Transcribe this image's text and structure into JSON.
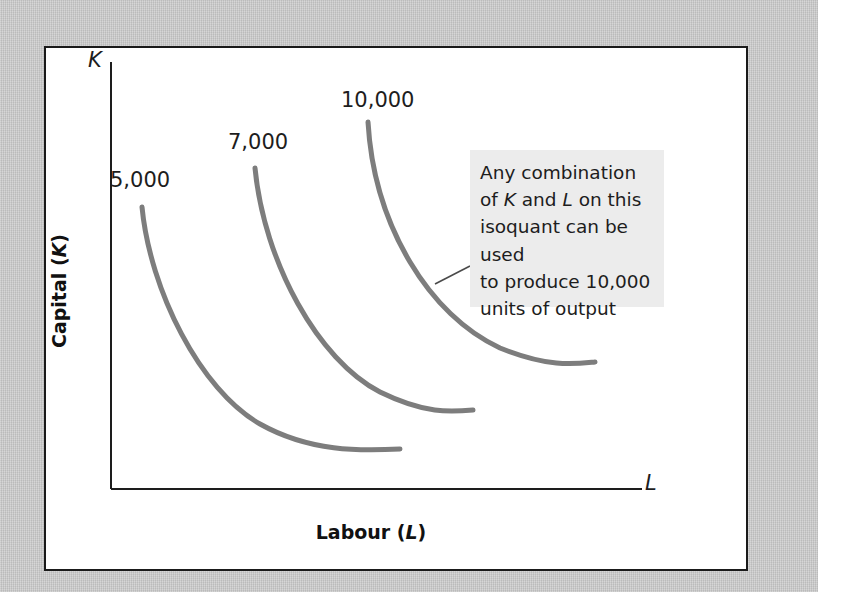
{
  "figure": {
    "type": "isoquant-map",
    "axes": {
      "y_axis_title": "Capital (K)",
      "y_axis_title_plain": "Capital",
      "y_axis_symbol": "K",
      "x_axis_title": "Labour (L)",
      "x_axis_title_plain": "Labour",
      "x_axis_symbol": "L",
      "y_axis_letter": "K",
      "x_axis_letter": "L"
    },
    "curve_labels": [
      "5,000",
      "7,000",
      "10,000"
    ],
    "annotation": {
      "text": "Any combination of K and L on this isoquant can be used to produce 10,000 units of output",
      "lines": [
        "Any combination",
        "of K and L on this",
        "isoquant can be used",
        "to produce 10,000",
        "units of output"
      ],
      "refers_to": "10,000"
    },
    "colors": {
      "background": "#c8c8c8",
      "panel": "#ffffff",
      "panel_border": "#1a1a1a",
      "curve": "#7d7d7d",
      "axis": "#1d1d1d",
      "callout_background": "#ececec",
      "callout_leader": "#4a4a4a",
      "text": "#1d1d1d"
    }
  },
  "chart_data": {
    "type": "line",
    "title": "",
    "xlabel": "Labour (L)",
    "ylabel": "Capital (K)",
    "grid": false,
    "legend": "none",
    "annotations": [
      {
        "text": "Any combination of K and L on this isoquant can be used to produce 10,000 units of output",
        "target_series": "10,000"
      }
    ],
    "series": [
      {
        "name": "5,000",
        "label": "5,000",
        "path": "M 142 207 C 150 290, 200 390, 260 424 C 310 452, 360 451, 400 449"
      },
      {
        "name": "7,000",
        "label": "7,000",
        "path": "M 255 168 C 264 262, 318 360, 380 392 C 425 414, 450 412, 473 410"
      },
      {
        "name": "10,000",
        "label": "10,000",
        "path": "M 368 122 C 374 226, 430 316, 500 348 C 550 368, 575 364, 595 362"
      }
    ]
  }
}
